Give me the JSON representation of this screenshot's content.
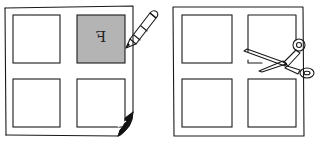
{
  "illustration": {
    "left_panel": {
      "description": "sheet with 4 panels, top-right panel shaded and marked with mirrored letter, pencil marking it, bottom-right corner curled",
      "marked_panel_letter": "F",
      "shaded_color": "#b4b4b4",
      "tool": "pencil-icon",
      "corner": "curled-corner"
    },
    "right_panel": {
      "description": "sheet with 4 panels, scissors cutting into the top-right panel",
      "tool": "scissors-icon"
    },
    "colors": {
      "line": "#1a1a1a",
      "background": "#ffffff"
    }
  }
}
